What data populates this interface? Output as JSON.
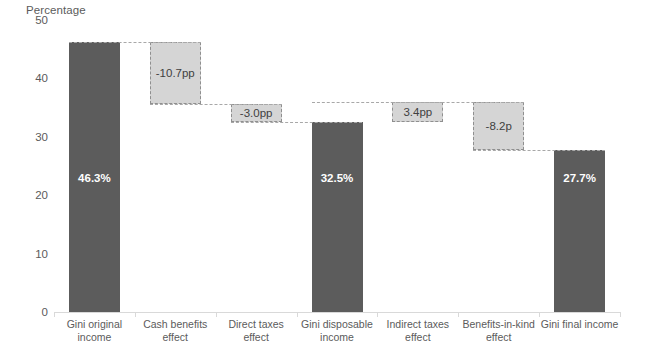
{
  "chart_data": {
    "type": "bar",
    "subtype": "waterfall",
    "title": "",
    "ylabel": "Percentage",
    "xlabel": "",
    "ylim": [
      0,
      50
    ],
    "yticks": [
      0,
      10,
      20,
      30,
      40,
      50
    ],
    "grid": false,
    "legend": null,
    "categories": [
      "Gini original\nincome",
      "Cash benefits\neffect",
      "Direct taxes\neffect",
      "Gini disposable\nincome",
      "Indirect taxes\neffect",
      "Benefits-in-kind\neffect",
      "Gini final income"
    ],
    "bars": [
      {
        "label": "Gini original income",
        "kind": "total",
        "value": 46.3,
        "base": 0.0,
        "top": 46.3,
        "display": "46.3%"
      },
      {
        "label": "Cash benefits effect",
        "kind": "delta",
        "value": -10.7,
        "base": 35.6,
        "top": 46.3,
        "display": "-10.7pp"
      },
      {
        "label": "Direct taxes effect",
        "kind": "delta",
        "value": -3.0,
        "base": 32.6,
        "top": 35.6,
        "display": "-3.0pp"
      },
      {
        "label": "Gini disposable income",
        "kind": "total",
        "value": 32.5,
        "base": 0.0,
        "top": 32.5,
        "display": "32.5%"
      },
      {
        "label": "Indirect taxes effect",
        "kind": "delta",
        "value": 3.4,
        "base": 32.5,
        "top": 35.9,
        "display": "3.4pp"
      },
      {
        "label": "Benefits-in-kind effect",
        "kind": "delta",
        "value": -8.2,
        "base": 27.7,
        "top": 35.9,
        "display": "-8.2p"
      },
      {
        "label": "Gini final income",
        "kind": "total",
        "value": 27.7,
        "base": 0.0,
        "top": 27.7,
        "display": "27.7%"
      }
    ],
    "colors": {
      "total_bar": "#5c5c5c",
      "delta_bar": "#d5d5d5",
      "delta_border": "#8f8f8f",
      "connector": "#a8a8a8",
      "axis": "#d9d9d9",
      "text": "#5b5b5b",
      "total_value_text": "#ffffff"
    }
  },
  "axis": {
    "y_title": "Percentage",
    "y_tick_labels": [
      "50",
      "40",
      "30",
      "20",
      "10",
      "0"
    ]
  }
}
